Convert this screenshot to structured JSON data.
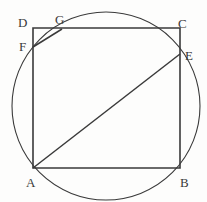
{
  "figure": {
    "background_color": "#fdfdfc",
    "stroke_color": "#3a3a3a",
    "label_color": "#3a3a3a",
    "stroke_width": 1.4,
    "circle_stroke_width": 1.1
  },
  "geometry": {
    "square": {
      "name": "ABCD",
      "vertices": [
        {
          "id": "A",
          "x": 33,
          "y": 168
        },
        {
          "id": "B",
          "x": 180,
          "y": 168
        },
        {
          "id": "C",
          "x": 180,
          "y": 28
        },
        {
          "id": "D",
          "x": 33,
          "y": 28
        }
      ],
      "side_horizontal": 147,
      "side_vertical": 140
    },
    "circle": {
      "center_x": 106,
      "center_y": 106,
      "radius": 94,
      "passes_through": [
        "A",
        "F",
        "G",
        "E"
      ]
    },
    "points": [
      {
        "id": "F",
        "x": 33,
        "y": 47,
        "on": "left-side-DA"
      },
      {
        "id": "G",
        "x": 62,
        "y": 29,
        "on": "top-side-DC"
      },
      {
        "id": "E",
        "x": 180,
        "y": 54,
        "on": "right-side-CB"
      }
    ],
    "segments": [
      {
        "id": "AE",
        "from": "A",
        "to": "E",
        "x1": 33,
        "y1": 168,
        "x2": 180,
        "y2": 54
      },
      {
        "id": "FG",
        "from": "F",
        "to": "G",
        "x1": 33,
        "y1": 47,
        "x2": 62,
        "y2": 29
      }
    ]
  },
  "labels": [
    {
      "id": "label-A",
      "text": "A",
      "x": 26,
      "y": 176
    },
    {
      "id": "label-B",
      "text": "B",
      "x": 180,
      "y": 176
    },
    {
      "id": "label-C",
      "text": "C",
      "x": 178,
      "y": 17
    },
    {
      "id": "label-D",
      "text": "D",
      "x": 18,
      "y": 16
    },
    {
      "id": "label-E",
      "text": "E",
      "x": 185,
      "y": 49
    },
    {
      "id": "label-F",
      "text": "F",
      "x": 19,
      "y": 40
    },
    {
      "id": "label-G",
      "text": "G",
      "x": 55,
      "y": 13
    }
  ]
}
